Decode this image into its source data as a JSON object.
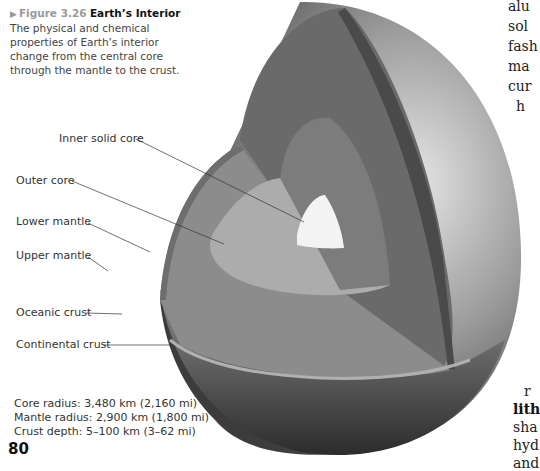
{
  "figure": {
    "marker": "▶",
    "number": "Figure 3.26",
    "title": "Earth’s Interior",
    "caption_lines": [
      "The physical and chemical",
      "properties of Earth’s interior",
      "change from the central core",
      "through the mantle to the crust."
    ],
    "labels": {
      "inner_core": "Inner solid core",
      "outer_core": "Outer core",
      "lower_mantle": "Lower mantle",
      "upper_mantle": "Upper mantle",
      "oceanic_crust": "Oceanic crust",
      "continental_crust": "Continental crust"
    },
    "stats": [
      "Core radius: 3,480 km (2,160 mi)",
      "Mantle radius: 2,900 km (1,800 mi)",
      "Crust depth: 5–100 km (3–62 mi)"
    ]
  },
  "page_number": "80",
  "body_text_fragments": {
    "top": [
      "alu",
      "sol",
      "fash",
      "ma",
      "cur",
      "h"
    ],
    "bottom": [
      "r",
      "lith",
      "sha",
      "hyd",
      "and"
    ]
  }
}
